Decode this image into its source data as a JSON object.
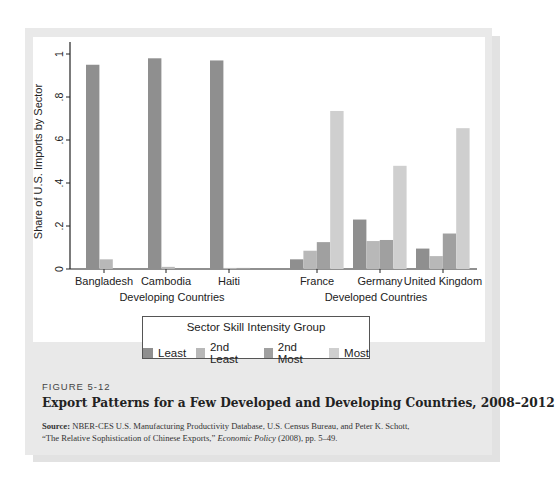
{
  "figure": {
    "label": "FIGURE 5-12",
    "title": "Export Patterns for a Few Developed and Developing Countries, 2008–2012",
    "source_label": "Source:",
    "source_line1": "NBER-CES U.S. Manufacturing Productivity Database, U.S. Census Bureau, and Peter K. Schott,",
    "source_line2_pre": "“The Relative Sophistication of Chinese Exports,” ",
    "source_line2_italic": "Economic Policy",
    "source_line2_post": " (2008), pp. 5–49."
  },
  "legend": {
    "title": "Sector Skill Intensity Group",
    "items": [
      {
        "label": "Least",
        "color": "#8f8f8f"
      },
      {
        "label": "2nd Least",
        "color": "#b8b8b8"
      },
      {
        "label": "2nd Most",
        "color": "#a0a0a0"
      },
      {
        "label": "Most",
        "color": "#cfcfcf"
      }
    ]
  },
  "chart_data": {
    "type": "bar",
    "title": "Export Patterns for a Few Developed and Developing Countries, 2008–2012",
    "xlabel": "",
    "ylabel": "Share of U.S. Imports by Sector",
    "ylim": [
      0,
      1
    ],
    "yticks": [
      "0",
      ".2",
      ".4",
      ".6",
      ".8",
      "1"
    ],
    "grid": false,
    "legend_position": "bottom",
    "groups": [
      {
        "label": "Developing Countries",
        "categories": [
          "Bangladesh",
          "Cambodia",
          "Haiti"
        ]
      },
      {
        "label": "Developed Countries",
        "categories": [
          "France",
          "Germany",
          "United Kingdom"
        ]
      }
    ],
    "categories": [
      "Bangladesh",
      "Cambodia",
      "Haiti",
      "France",
      "Germany",
      "United Kingdom"
    ],
    "series": [
      {
        "name": "Least",
        "values": [
          0.95,
          0.98,
          0.97,
          0.045,
          0.23,
          0.095
        ]
      },
      {
        "name": "2nd Least",
        "values": [
          0.045,
          0.01,
          0.005,
          0.085,
          0.13,
          0.06
        ]
      },
      {
        "name": "2nd Most",
        "values": [
          0.0,
          0.0,
          0.005,
          0.125,
          0.135,
          0.165
        ]
      },
      {
        "name": "Most",
        "values": [
          0.0,
          0.0,
          0.0,
          0.735,
          0.48,
          0.655
        ]
      }
    ]
  }
}
